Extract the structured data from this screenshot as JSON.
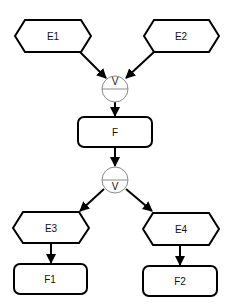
{
  "diagram": {
    "type": "event-driven process chain",
    "nodes": {
      "e1": {
        "label": "E1",
        "kind": "event"
      },
      "e2": {
        "label": "E2",
        "kind": "event"
      },
      "join": {
        "label": "V",
        "kind": "or-connector"
      },
      "f": {
        "label": "F",
        "kind": "function"
      },
      "split": {
        "label": "V",
        "kind": "or-connector"
      },
      "e3": {
        "label": "E3",
        "kind": "event"
      },
      "e4": {
        "label": "E4",
        "kind": "event"
      },
      "f1": {
        "label": "F1",
        "kind": "function"
      },
      "f2": {
        "label": "F2",
        "kind": "function"
      }
    },
    "edges": [
      {
        "from": "E1",
        "to": "join"
      },
      {
        "from": "E2",
        "to": "join"
      },
      {
        "from": "join",
        "to": "F"
      },
      {
        "from": "F",
        "to": "split"
      },
      {
        "from": "split",
        "to": "E3"
      },
      {
        "from": "split",
        "to": "E4"
      },
      {
        "from": "E3",
        "to": "F1"
      },
      {
        "from": "E4",
        "to": "F2"
      }
    ]
  }
}
